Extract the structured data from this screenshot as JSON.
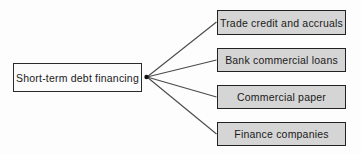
{
  "diagram": {
    "root": {
      "label": "Short-term debt financing"
    },
    "children": [
      {
        "label": "Trade credit and accruals"
      },
      {
        "label": "Bank commercial loans"
      },
      {
        "label": "Commercial paper"
      },
      {
        "label": "Finance companies"
      }
    ],
    "colors": {
      "root_fill": "#fbfbfb",
      "child_fill": "#d5d5d5",
      "box_border": "#222222",
      "connector_line": "#4a4a4a",
      "junction_dot": "#111111",
      "text": "#1a1a1a",
      "background": "#fdfdfd"
    }
  }
}
